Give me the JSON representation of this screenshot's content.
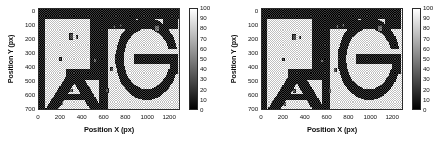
{
  "figure": {
    "panel_count": 2,
    "background": "#ffffff"
  },
  "axis_titles": {
    "x": "Position X (px)",
    "y": "Position Y (px)"
  },
  "panels": [
    {
      "name": "left-heatmap-panel",
      "xticks": [
        "0",
        "200",
        "400",
        "600",
        "800",
        "1000",
        "1200"
      ],
      "yticks": [
        "0",
        "100",
        "200",
        "300",
        "400",
        "500",
        "600",
        "700"
      ],
      "colorbar_ticks": [
        "100",
        "90",
        "80",
        "70",
        "60",
        "50",
        "40",
        "30",
        "20",
        "10",
        "0"
      ]
    },
    {
      "name": "right-heatmap-panel",
      "xticks": [
        "0",
        "200",
        "400",
        "600",
        "800",
        "1000",
        "1200"
      ],
      "yticks": [
        "0",
        "100",
        "200",
        "300",
        "400",
        "500",
        "600",
        "700"
      ],
      "colorbar_ticks": [
        "100",
        "90",
        "80",
        "70",
        "60",
        "50",
        "40",
        "30",
        "20",
        "10",
        "0"
      ]
    }
  ],
  "chart_data": [
    {
      "type": "heatmap",
      "title": "",
      "xlabel": "Position X (px)",
      "ylabel": "Position Y (px)",
      "xlim": [
        0,
        1300
      ],
      "ylim": [
        0,
        730
      ],
      "y_axis_inverted": true,
      "xticks": [
        0,
        200,
        400,
        600,
        800,
        1000,
        1200
      ],
      "yticks": [
        0,
        100,
        200,
        300,
        400,
        500,
        600,
        700
      ],
      "grid": false,
      "colormap": "gray",
      "colorbar": {
        "position": "right",
        "vmin": 0,
        "vmax": 100,
        "ticks": [
          0,
          10,
          20,
          30,
          40,
          50,
          60,
          70,
          80,
          90,
          100
        ]
      },
      "description": "Grayscale dithered (checkerboard) intensity map of a scanned surface; dark (low value, ~0-15) regions trace large block letter strokes 'A', 'I'/'L', 'G' over a light (high value, ~85-100) dithered background, with a handful of small dark rectangular defect patches.",
      "background_value": 92,
      "stroke_value": 8,
      "defects": [
        {
          "x": 300,
          "y": 200,
          "w": 38,
          "h": 46,
          "value": 12
        },
        {
          "x": 350,
          "y": 205,
          "w": 20,
          "h": 26,
          "value": 18
        },
        {
          "x": 200,
          "y": 365,
          "w": 18,
          "h": 20,
          "value": 10
        },
        {
          "x": 520,
          "y": 375,
          "w": 22,
          "h": 24,
          "value": 22
        },
        {
          "x": 675,
          "y": 440,
          "w": 32,
          "h": 34,
          "value": 14
        },
        {
          "x": 635,
          "y": 595,
          "w": 30,
          "h": 36,
          "value": 16
        },
        {
          "x": 300,
          "y": 595,
          "w": 30,
          "h": 30,
          "value": 20
        },
        {
          "x": 215,
          "y": 690,
          "w": 22,
          "h": 26,
          "value": 24
        },
        {
          "x": 1095,
          "y": 140,
          "w": 42,
          "h": 46,
          "value": 26
        },
        {
          "x": 760,
          "y": 120,
          "w": 20,
          "h": 22,
          "value": 30
        },
        {
          "x": 700,
          "y": 130,
          "w": 18,
          "h": 26,
          "value": 28
        }
      ]
    },
    {
      "type": "heatmap",
      "title": "",
      "xlabel": "Position X (px)",
      "ylabel": "Position Y (px)",
      "xlim": [
        0,
        1300
      ],
      "ylim": [
        0,
        730
      ],
      "y_axis_inverted": true,
      "xticks": [
        0,
        200,
        400,
        600,
        800,
        1000,
        1200
      ],
      "yticks": [
        0,
        100,
        200,
        300,
        400,
        500,
        600,
        700
      ],
      "grid": false,
      "colormap": "gray",
      "colorbar": {
        "position": "right",
        "vmin": 0,
        "vmax": 100,
        "ticks": [
          0,
          10,
          20,
          30,
          40,
          50,
          60,
          70,
          80,
          90,
          100
        ]
      },
      "description": "Second grayscale dithered intensity map of the same scanned surface, nearly identical block-letter pattern with slightly different defect positions and contrast.",
      "background_value": 93,
      "stroke_value": 7,
      "defects": [
        {
          "x": 300,
          "y": 205,
          "w": 36,
          "h": 44,
          "value": 12
        },
        {
          "x": 352,
          "y": 208,
          "w": 20,
          "h": 24,
          "value": 20
        },
        {
          "x": 200,
          "y": 370,
          "w": 18,
          "h": 20,
          "value": 10
        },
        {
          "x": 560,
          "y": 378,
          "w": 26,
          "h": 22,
          "value": 24
        },
        {
          "x": 680,
          "y": 445,
          "w": 32,
          "h": 34,
          "value": 14
        },
        {
          "x": 630,
          "y": 600,
          "w": 30,
          "h": 36,
          "value": 16
        },
        {
          "x": 300,
          "y": 598,
          "w": 28,
          "h": 30,
          "value": 22
        },
        {
          "x": 212,
          "y": 692,
          "w": 22,
          "h": 26,
          "value": 26
        },
        {
          "x": 1095,
          "y": 142,
          "w": 42,
          "h": 46,
          "value": 26
        },
        {
          "x": 755,
          "y": 118,
          "w": 20,
          "h": 22,
          "value": 30
        },
        {
          "x": 700,
          "y": 128,
          "w": 18,
          "h": 26,
          "value": 28
        }
      ]
    }
  ]
}
